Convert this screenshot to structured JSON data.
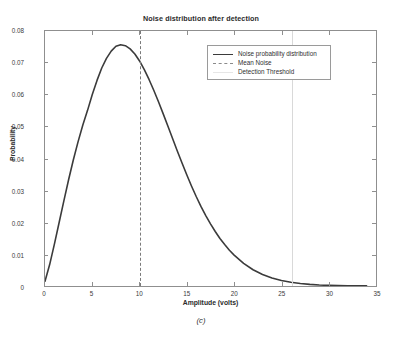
{
  "figure": {
    "caption": "(c)"
  },
  "chart_data": {
    "type": "line",
    "title": "Noise distribution after detection",
    "xlabel": "Amplitude (volts)",
    "ylabel": "Probability",
    "xlim": [
      0,
      35
    ],
    "ylim": [
      0,
      0.08
    ],
    "xticks": [
      0,
      5,
      10,
      15,
      20,
      25,
      30,
      35
    ],
    "yticks": [
      0,
      0.01,
      0.02,
      0.03,
      0.04,
      0.05,
      0.06,
      0.07,
      0.08
    ],
    "xtick_labels": [
      "0",
      "5",
      "10",
      "15",
      "20",
      "25",
      "30",
      "35"
    ],
    "ytick_labels": [
      "0",
      "0.01",
      "0.02",
      "0.03",
      "0.04",
      "0.05",
      "0.06",
      "0.07",
      "0.08"
    ],
    "grid": false,
    "legend_position": "upper right",
    "legend": [
      {
        "label": "Noise probability distribution",
        "style": "solid",
        "color": "#3b3b3b"
      },
      {
        "label": "Mean Noise",
        "style": "dashed",
        "color": "#8a8a8a"
      },
      {
        "label": "Detection Threshold",
        "style": "solid-faint",
        "color": "#e6e6e6"
      }
    ],
    "series": [
      {
        "name": "Noise probability distribution",
        "style": "solid",
        "color": "#3b3b3b",
        "x": [
          0,
          0.5,
          1,
          1.5,
          2,
          2.5,
          3,
          3.5,
          4,
          4.5,
          5,
          5.5,
          6,
          6.5,
          7,
          7.5,
          8,
          8.5,
          9,
          9.5,
          10,
          10.5,
          11,
          11.5,
          12,
          12.5,
          13,
          13.5,
          14,
          14.5,
          15,
          15.5,
          16,
          16.5,
          17,
          17.5,
          18,
          18.5,
          19,
          19.5,
          20,
          21,
          22,
          23,
          24,
          25,
          26,
          27,
          28,
          29,
          30,
          31,
          32,
          33,
          34
        ],
        "y": [
          0.0015,
          0.0068,
          0.0132,
          0.02,
          0.0268,
          0.0334,
          0.0396,
          0.0453,
          0.0505,
          0.0551,
          0.0601,
          0.0645,
          0.0684,
          0.0714,
          0.0737,
          0.0752,
          0.0757,
          0.0754,
          0.0744,
          0.0728,
          0.0706,
          0.0679,
          0.0648,
          0.0614,
          0.0578,
          0.054,
          0.0501,
          0.0462,
          0.0423,
          0.0385,
          0.0348,
          0.0313,
          0.028,
          0.0249,
          0.0221,
          0.0195,
          0.0171,
          0.0149,
          0.013,
          0.0112,
          0.0097,
          0.0071,
          0.0051,
          0.0036,
          0.0025,
          0.0017,
          0.0012,
          0.0008,
          0.0005,
          0.0003,
          0.0002,
          0.00015,
          0.0001,
          8e-05,
          6e-05
        ]
      }
    ],
    "annotations": [
      {
        "name": "Mean Noise",
        "type": "vline",
        "x": 10,
        "style": "dashed",
        "color": "#7a7a7a"
      },
      {
        "name": "Detection Threshold",
        "type": "vline",
        "x": 26,
        "style": "solid",
        "color": "#d9d9d9"
      }
    ],
    "peak": {
      "x": 8,
      "y": 0.0757
    }
  }
}
